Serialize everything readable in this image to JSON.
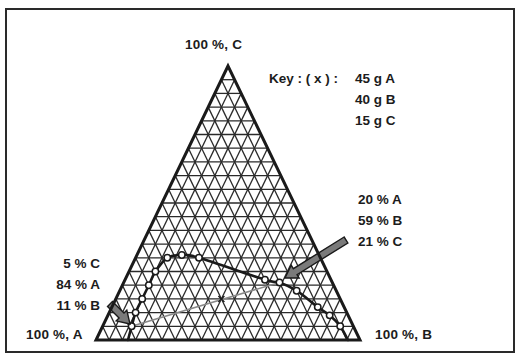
{
  "vertices": {
    "top_label": "100 %,  C",
    "left_label": "100 %, A",
    "right_label": "100 %, B"
  },
  "key": {
    "prefix": "Key :  ( x ) :",
    "lines": [
      "45 g A",
      "40 g B",
      "15 g C"
    ]
  },
  "annotations": {
    "left_point": {
      "lines": [
        "5 % C",
        "84 % A",
        "11 % B"
      ]
    },
    "right_point": {
      "lines": [
        "20 % A",
        "59 % B",
        "21 % C"
      ]
    }
  },
  "colors": {
    "line": "#1a1a1a",
    "grid": "#2a2a2a",
    "tie_line": "#8a8a8a",
    "arrow_fill": "#7a7a7a",
    "background": "#ffffff"
  },
  "chart_data": {
    "type": "ternary",
    "title": "",
    "components": [
      "A",
      "B",
      "C"
    ],
    "vertices": {
      "top": "C",
      "bottom_left": "A",
      "bottom_right": "B"
    },
    "grid_divisions": 20,
    "grid_step_percent": 5,
    "key": {
      "marker": "x",
      "composition_g": {
        "A": 45,
        "B": 40,
        "C": 15
      }
    },
    "binodal_curve_points_percent": [
      {
        "A": 84,
        "B": 11,
        "C": 5
      },
      {
        "A": 80,
        "B": 10,
        "C": 10
      },
      {
        "A": 75,
        "B": 10,
        "C": 15
      },
      {
        "A": 70,
        "B": 10,
        "C": 20
      },
      {
        "A": 65,
        "B": 10,
        "C": 25
      },
      {
        "A": 58,
        "B": 12,
        "C": 30
      },
      {
        "A": 52,
        "B": 17,
        "C": 31
      },
      {
        "A": 46,
        "B": 24,
        "C": 30
      },
      {
        "A": 25,
        "B": 53,
        "C": 22
      },
      {
        "A": 20,
        "B": 59,
        "C": 21
      },
      {
        "A": 15,
        "B": 67,
        "C": 18
      },
      {
        "A": 10,
        "B": 78,
        "C": 12
      },
      {
        "A": 7,
        "B": 84,
        "C": 9
      },
      {
        "A": 5,
        "B": 90,
        "C": 5
      }
    ],
    "tie_line": {
      "from": {
        "A": 84,
        "B": 11,
        "C": 5
      },
      "through": {
        "A": 45,
        "B": 40,
        "C": 15
      },
      "to": {
        "A": 20,
        "B": 59,
        "C": 21
      }
    },
    "labeled_points": [
      {
        "label": "5 % C, 84 % A, 11 % B",
        "A": 84,
        "B": 11,
        "C": 5
      },
      {
        "label": "20 % A, 59 % B, 21 % C",
        "A": 20,
        "B": 59,
        "C": 21
      }
    ]
  }
}
